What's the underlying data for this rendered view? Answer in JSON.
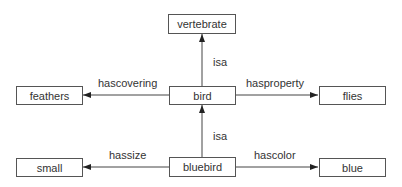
{
  "diagram": {
    "type": "semantic-network",
    "nodes": [
      {
        "id": "vertebrate",
        "label": "vertebrate"
      },
      {
        "id": "feathers",
        "label": "feathers"
      },
      {
        "id": "bird",
        "label": "bird"
      },
      {
        "id": "flies",
        "label": "flies"
      },
      {
        "id": "small",
        "label": "small"
      },
      {
        "id": "bluebird",
        "label": "bluebird"
      },
      {
        "id": "blue",
        "label": "blue"
      }
    ],
    "edges": [
      {
        "from": "bird",
        "to": "vertebrate",
        "label": "isa"
      },
      {
        "from": "bird",
        "to": "feathers",
        "label": "hascovering"
      },
      {
        "from": "bird",
        "to": "flies",
        "label": "hasproperty"
      },
      {
        "from": "bluebird",
        "to": "bird",
        "label": "isa"
      },
      {
        "from": "bluebird",
        "to": "small",
        "label": "hassize"
      },
      {
        "from": "bluebird",
        "to": "blue",
        "label": "hascolor"
      }
    ]
  }
}
